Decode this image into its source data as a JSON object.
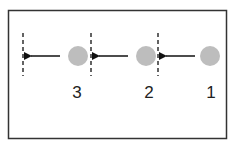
{
  "diagram": {
    "colors": {
      "frame": "#333333",
      "circle": "#bdbdbd",
      "arrow": "#111111",
      "dashed_line": "#222222",
      "label": "#222222"
    },
    "steps": [
      {
        "label": "3",
        "icon": "circle-icon"
      },
      {
        "label": "2",
        "icon": "circle-icon"
      },
      {
        "label": "1",
        "icon": "circle-icon"
      }
    ],
    "arrow_direction": "left"
  }
}
